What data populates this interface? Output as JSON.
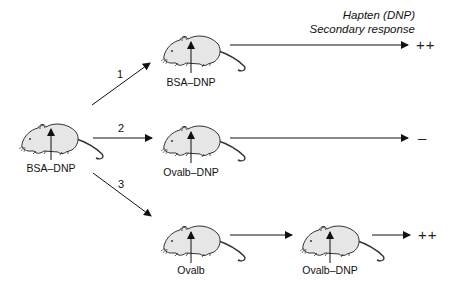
{
  "header": {
    "line1": "Hapten (DNP)",
    "line2": "Secondary response"
  },
  "mice": [
    {
      "id": "primary",
      "label": "BSA–DNP"
    },
    {
      "id": "route1",
      "label": "BSA–DNP"
    },
    {
      "id": "route2",
      "label": "Ovalb–DNP"
    },
    {
      "id": "route3a",
      "label": "Ovalb"
    },
    {
      "id": "route3b",
      "label": "Ovalb–DNP"
    }
  ],
  "routes": [
    {
      "number": "1",
      "result": "++"
    },
    {
      "number": "2",
      "result": "–"
    },
    {
      "number": "3",
      "result": "++"
    }
  ],
  "colors": {
    "line": "#111111",
    "mouse_fill": "#e6e6e6",
    "mouse_stroke": "#333333"
  }
}
